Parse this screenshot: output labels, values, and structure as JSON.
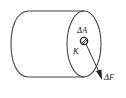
{
  "diagram": {
    "labels": {
      "area": "ΔA",
      "point": "K",
      "force": "ΔF"
    },
    "colors": {
      "stroke": "#444444",
      "text": "#222222",
      "background": "#ffffff"
    }
  }
}
